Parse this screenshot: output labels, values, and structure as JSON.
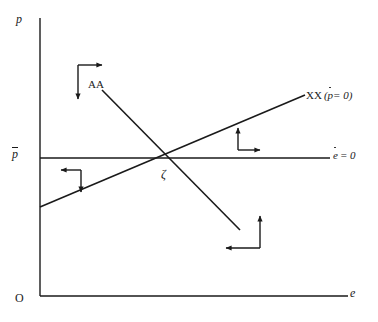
{
  "figure": {
    "type": "phase-diagram",
    "width": 378,
    "height": 322,
    "background_color": "#ffffff",
    "line_color": "#1a1a1a",
    "text_color": "#1a1a1a"
  },
  "axes": {
    "vertical": {
      "label": "p",
      "name": "price-level",
      "x_px": 40,
      "top_px": 18,
      "bottom_px": 296
    },
    "horizontal": {
      "label": "e",
      "name": "exchange-rate",
      "y_px": 296,
      "left_px": 40,
      "right_px": 348
    },
    "origin_label": "O"
  },
  "labels": {
    "p_axis": "p",
    "p_bar": "p",
    "p_bar_has_overbar": true,
    "origin": "O",
    "e_axis": "e",
    "edot_line": "e = 0",
    "edot_variable": "e",
    "edot_rhs": "= 0",
    "xx_curve": "XX",
    "xx_paren_open": "(",
    "xx_variable": "p",
    "xx_rhs": "= 0",
    "xx_paren_close": ")",
    "aa_curve": "AA",
    "equilibrium": "ζ"
  },
  "curves": [
    {
      "name": "xx-curve",
      "label": "XX (ṗ = 0)",
      "slope": "upward",
      "x1_px": 40,
      "y1_px": 207,
      "x2_px": 305,
      "y2_px": 95
    },
    {
      "name": "aa-curve",
      "label": "AA",
      "slope": "downward",
      "x1_px": 102,
      "y1_px": 90,
      "x2_px": 240,
      "y2_px": 230
    },
    {
      "name": "edot-zero-line",
      "label": "ė = 0",
      "slope": "horizontal",
      "x1_px": 40,
      "y1_px": 158,
      "x2_px": 330,
      "y2_px": 158
    }
  ],
  "equilibrium_point": {
    "name": "zeta",
    "label": "ζ",
    "x_px": 172,
    "y_px": 158
  },
  "arrow_pairs": [
    {
      "name": "arrows-upper-left",
      "quadrant": "upper-left",
      "corner_x_px": 78,
      "corner_y_px": 65,
      "horizontal_direction": "right",
      "vertical_direction": "down"
    },
    {
      "name": "arrows-left-middle",
      "quadrant": "left-middle",
      "corner_x_px": 81,
      "corner_y_px": 170,
      "horizontal_direction": "left",
      "vertical_direction": "down"
    },
    {
      "name": "arrows-right-middle",
      "quadrant": "right-middle",
      "corner_x_px": 238,
      "corner_y_px": 150,
      "horizontal_direction": "right",
      "vertical_direction": "up"
    },
    {
      "name": "arrows-lower-right",
      "quadrant": "lower-right",
      "corner_x_px": 260,
      "corner_y_px": 248,
      "horizontal_direction": "left",
      "vertical_direction": "up"
    }
  ]
}
